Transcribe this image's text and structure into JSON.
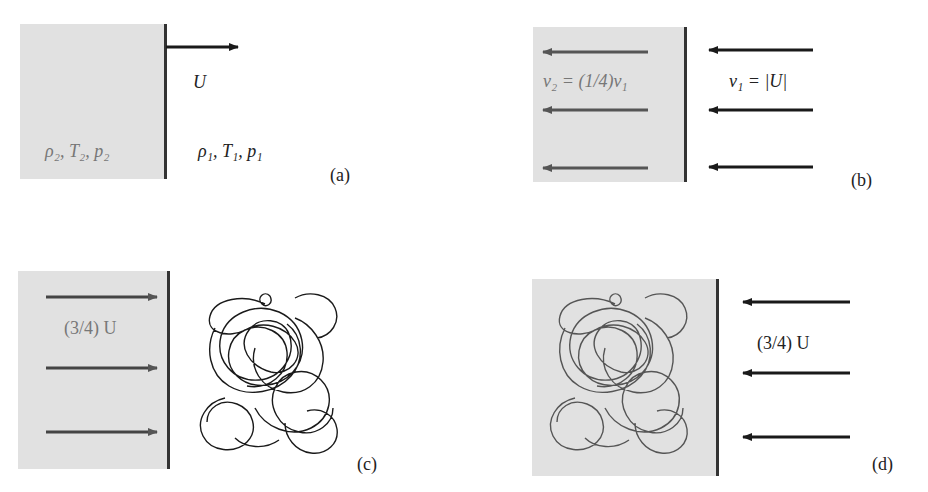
{
  "figure": {
    "panels": [
      {
        "id": "a",
        "tag": "(a)",
        "velocity_label": "U",
        "left_state": "ρ₂, T₂, p₂",
        "right_state": "ρ₁, T₁, p₁",
        "arrow_direction": "right"
      },
      {
        "id": "b",
        "tag": "(b)",
        "left_label": "v₂ = (1/4)v₁",
        "right_label": "v₁ = |U|",
        "arrow_direction": "left",
        "arrow_count_each_side": 3
      },
      {
        "id": "c",
        "tag": "(c)",
        "left_label": "(3/4) U",
        "arrow_direction": "right",
        "arrow_count": 3,
        "object": "tangled-polymer-coil"
      },
      {
        "id": "d",
        "tag": "(d)",
        "right_label": "(3/4) U",
        "arrow_direction": "left",
        "arrow_count": 3,
        "object": "tangled-polymer-coil"
      }
    ],
    "colors": {
      "shaded_region": "#e1e1e1",
      "wall": "#333333",
      "arrow_dark": "#1a1a1a",
      "arrow_gray": "#555555",
      "coil_dark": "#1a1a1a",
      "coil_gray": "#555555"
    }
  }
}
